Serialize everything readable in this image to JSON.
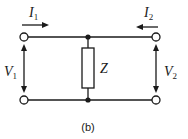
{
  "diagram": {
    "type": "two-port shunt impedance network",
    "caption": "(b)",
    "impedance": {
      "label": "Z"
    },
    "port1": {
      "current": {
        "main": "I",
        "sub": "1",
        "direction": "right"
      },
      "voltage": {
        "main": "V",
        "sub": "1"
      }
    },
    "port2": {
      "current": {
        "main": "I",
        "sub": "2",
        "direction": "left"
      },
      "voltage": {
        "main": "V",
        "sub": "2"
      }
    },
    "colors": {
      "stroke": "#1a1a1a",
      "background": "#ffffff"
    }
  }
}
